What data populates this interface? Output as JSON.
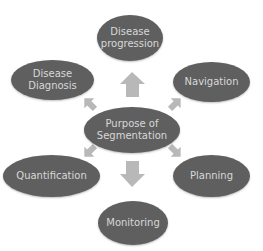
{
  "diagram": {
    "type": "radial-cycle",
    "center": {
      "label": "Purpose of\nSegmentation"
    },
    "nodes": [
      {
        "id": "disease-progression",
        "label": "Disease\nprogression"
      },
      {
        "id": "navigation",
        "label": "Navigation"
      },
      {
        "id": "planning",
        "label": "Planning"
      },
      {
        "id": "monitoring",
        "label": "Monitoring"
      },
      {
        "id": "quantification",
        "label": "Quantification"
      },
      {
        "id": "disease-diagnosis",
        "label": "Disease\nDiagnosis"
      }
    ],
    "edges": [
      {
        "from": "center",
        "to": "disease-progression",
        "direction": "up"
      },
      {
        "from": "center",
        "to": "navigation",
        "direction": "up-right"
      },
      {
        "from": "center",
        "to": "planning",
        "direction": "down-right"
      },
      {
        "from": "center",
        "to": "monitoring",
        "direction": "down"
      },
      {
        "from": "center",
        "to": "quantification",
        "direction": "down-left"
      },
      {
        "from": "center",
        "to": "disease-diagnosis",
        "direction": "up-left"
      }
    ],
    "colors": {
      "node_fill": "#5f5f5f",
      "node_text": "#d8d8d8",
      "arrow_fill": "#b8b8b8",
      "background": "#ffffff"
    }
  }
}
